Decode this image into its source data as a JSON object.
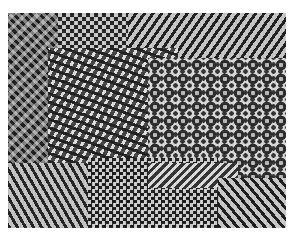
{
  "image": {
    "description": "Grayscale texture mosaic composed of regions with different geometric patterns: checkerboards, diagonal stripes, zigzags, and star/dot motifs",
    "background_color": "#ffffff",
    "regions": [
      {
        "name": "top-left-noise-zigzag",
        "pattern": "noisy zigzag"
      },
      {
        "name": "top-checker",
        "pattern": "checkerboard"
      },
      {
        "name": "top-diagonal-stripes",
        "pattern": "diagonal stripes"
      },
      {
        "name": "center-skewed-checker",
        "pattern": "skewed checker / diamonds"
      },
      {
        "name": "right-star-motif",
        "pattern": "stars and rings"
      },
      {
        "name": "bottom-left-zigzag",
        "pattern": "diagonal zigzag"
      },
      {
        "name": "bottom-center-checker",
        "pattern": "checkerboard"
      },
      {
        "name": "bottom-right-stripes",
        "pattern": "diagonal stripes"
      }
    ],
    "colors": {
      "dark": "#1e1e1e",
      "light": "#d0d0d0",
      "mid": "#8a8a8a"
    }
  }
}
